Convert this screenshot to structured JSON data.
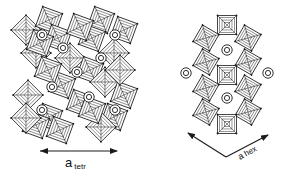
{
  "figure": {
    "panels": [
      {
        "id": "tetragonal",
        "description": "Tetragonal tungsten-bronze type framework of corner-sharing octahedra with cations in tunnels",
        "axis_label": {
          "main": "a",
          "sub": "tetr"
        },
        "octahedra": [
          [
            26,
            30
          ],
          [
            49,
            20
          ],
          [
            58,
            38
          ],
          [
            36,
            53
          ],
          [
            101,
            20
          ],
          [
            124,
            30
          ],
          [
            114,
            53
          ],
          [
            92,
            38
          ],
          [
            80,
            27
          ],
          [
            70,
            58
          ],
          [
            90,
            70
          ],
          [
            62,
            85
          ],
          [
            105,
            82
          ],
          [
            48,
            70
          ],
          [
            80,
            103
          ],
          [
            28,
            95
          ],
          [
            49,
            117
          ],
          [
            36,
            125
          ],
          [
            26,
            118
          ],
          [
            124,
            95
          ],
          [
            114,
            117
          ],
          [
            101,
            127
          ],
          [
            92,
            110
          ],
          [
            60,
            130
          ],
          [
            120,
            70
          ],
          [
            40,
            43
          ]
        ],
        "cation_rings": [
          [
            42,
            35
          ],
          [
            115,
            35
          ],
          [
            63,
            48
          ],
          [
            101,
            58
          ],
          [
            77,
            72
          ],
          [
            52,
            87
          ],
          [
            89,
            97
          ],
          [
            42,
            110
          ],
          [
            115,
            110
          ]
        ],
        "arrow": {
          "x1": 40,
          "y1": 151,
          "x2": 117,
          "y2": 151
        }
      },
      {
        "id": "hexagonal",
        "description": "Hexagonal tungsten-bronze type framework: octahedra arranged around hexagonal tunnels with cations",
        "axis_label": {
          "main": "a",
          "sub": "hex"
        },
        "octahedra": [
          [
            227,
            25
          ],
          [
            206,
            38
          ],
          [
            248,
            38
          ],
          [
            206,
            62
          ],
          [
            248,
            62
          ],
          [
            227,
            75
          ],
          [
            206,
            88
          ],
          [
            248,
            88
          ],
          [
            206,
            112
          ],
          [
            248,
            112
          ],
          [
            227,
            124
          ]
        ],
        "cation_rings": [
          [
            227,
            50
          ],
          [
            186,
            73
          ],
          [
            268,
            73
          ],
          [
            227,
            98
          ]
        ],
        "arrow": {
          "left": [
            188,
            133
          ],
          "vertex": [
            226,
            157
          ],
          "right": [
            268,
            135
          ]
        }
      }
    ],
    "colors": {
      "line": "#1a1a1a",
      "background": "#ffffff"
    }
  }
}
